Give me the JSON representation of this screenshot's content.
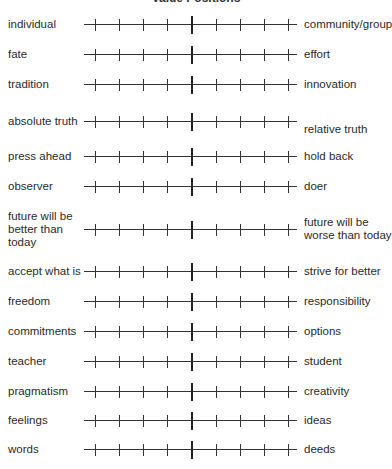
{
  "title": "Value Positions",
  "rows": [
    {
      "left": "individual",
      "right": "community/group",
      "y": 25
    },
    {
      "left": "fate",
      "right": "effort",
      "y": 55
    },
    {
      "left": "tradition",
      "right": "innovation",
      "y": 85
    },
    {
      "left": "absolute truth",
      "right": "relative truth",
      "y": 122,
      "right_offset": 8
    },
    {
      "left": "press ahead",
      "right": "hold back",
      "y": 157
    },
    {
      "left": "observer",
      "right": "doer",
      "y": 187
    },
    {
      "left": "future will be better than today",
      "right": "future will be worse than today",
      "y": 230
    },
    {
      "left": "accept what is",
      "right": "strive for better",
      "y": 272
    },
    {
      "left": "freedom",
      "right": "responsibility",
      "y": 302
    },
    {
      "left": "commitments",
      "right": "options",
      "y": 332
    },
    {
      "left": "teacher",
      "right": "student",
      "y": 362
    },
    {
      "left": "pragmatism",
      "right": "creativity",
      "y": 392
    },
    {
      "left": "feelings",
      "right": "ideas",
      "y": 421
    },
    {
      "left": "words",
      "right": "deeds",
      "y": 450
    }
  ],
  "scale": {
    "ticks_per_side": 4,
    "tick_positions": [
      11,
      35,
      59,
      83,
      132,
      156,
      180,
      204
    ],
    "center_position": 107
  }
}
